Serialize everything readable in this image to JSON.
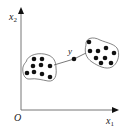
{
  "diagram": {
    "axes": {
      "x_label": "x",
      "x_sub": "1",
      "y_label": "x",
      "y_sub": "2",
      "origin_label": "O"
    },
    "bridge_point_label": "y",
    "clusters": [
      {
        "name": "left-cluster",
        "points": [
          [
            34,
            59
          ],
          [
            42,
            59
          ],
          [
            33,
            66
          ],
          [
            41,
            65
          ],
          [
            50,
            66
          ],
          [
            27,
            73
          ],
          [
            34,
            72
          ],
          [
            42,
            74
          ],
          [
            50,
            77
          ]
        ]
      },
      {
        "name": "right-cluster",
        "points": [
          [
            89,
            42
          ],
          [
            90,
            51
          ],
          [
            98,
            51
          ],
          [
            106,
            48
          ],
          [
            114,
            53
          ],
          [
            96,
            58
          ],
          [
            105,
            58
          ],
          [
            101,
            63
          ],
          [
            111,
            63
          ]
        ]
      }
    ],
    "bridge_point": [
      74,
      59
    ],
    "colors": {
      "ink": "#111111",
      "axis": "#777777",
      "outline": "#666666"
    }
  }
}
